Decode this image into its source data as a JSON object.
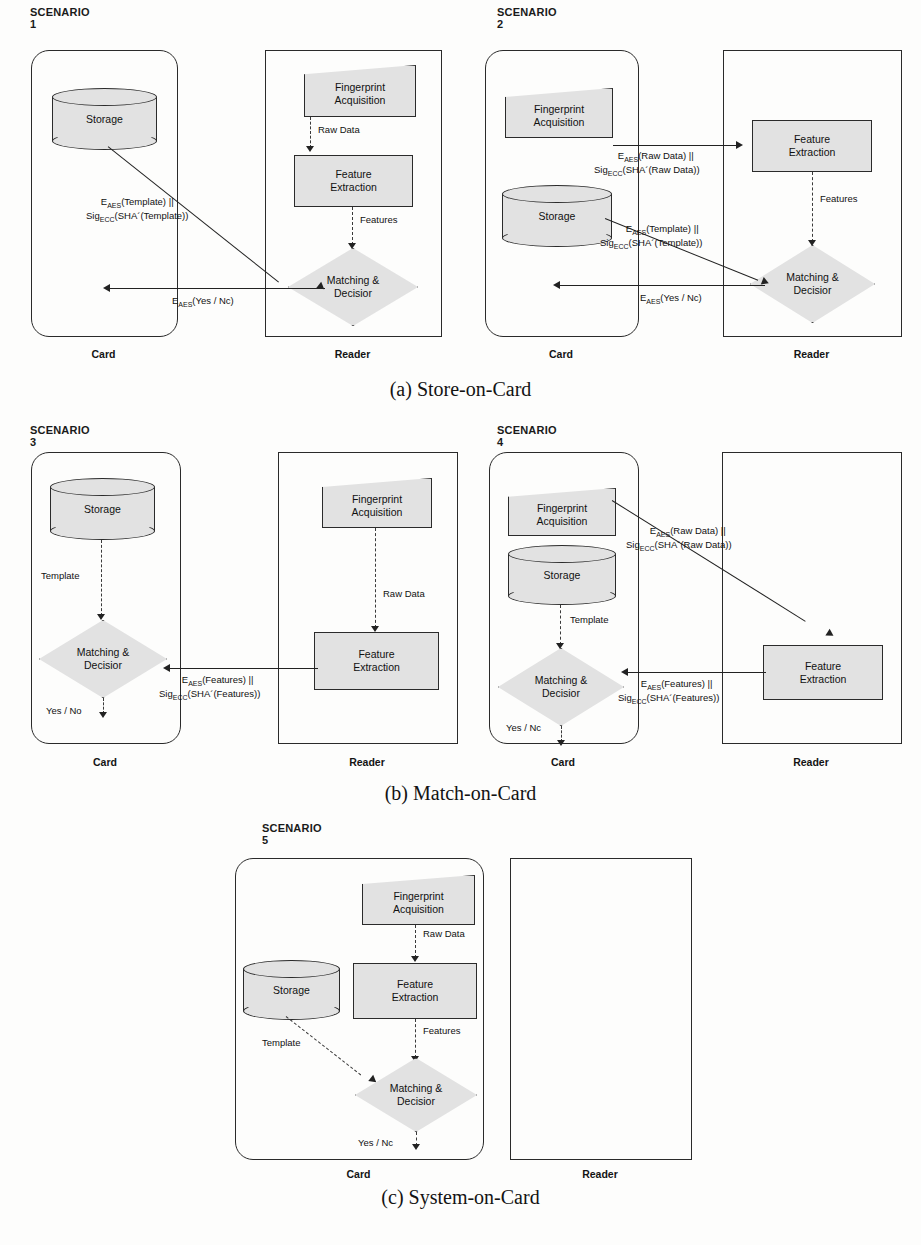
{
  "figure": {
    "captions": [
      {
        "id": "a",
        "text": "(a) Store-on-Card"
      },
      {
        "id": "b",
        "text": "(b) Match-on-Card"
      },
      {
        "id": "c",
        "text": "(c) System-on-Card"
      }
    ]
  },
  "labels": {
    "card": "Card",
    "reader": "Reader",
    "storage": "Storage",
    "fingerprint_acquisition": "Fingerprint\nAcquisition",
    "fingerprint_acquisition_l1": "Fingerprint",
    "fingerprint_acquisition_l2": "Acquisition",
    "feature_extraction_l1": "Feature",
    "feature_extraction_l2": "Extraction",
    "matching_decision_l1": "Matching &",
    "matching_decision_l2": "Decisior",
    "raw_data": "Raw Data",
    "features": "Features",
    "template": "Template",
    "yes_no": "Yes / No",
    "yes_nc": "Yes / Nc"
  },
  "crypto": {
    "e_prefix": "E",
    "aes_sub": "AES",
    "sig_prefix": "Sig",
    "ecc_sub": "ECC",
    "template_line1": "(Template) ||",
    "template_line2": "(SHA´(Template))",
    "rawdata_line1": "(Raw Data) ||",
    "rawdata_line2": "(SHA´(Raw Data))",
    "features_line1": "(Features) ||",
    "features_line2": "(SHA´(Features))",
    "yesno_payload": "(Yes / Nc)"
  },
  "scenarios": [
    {
      "id": 1,
      "title": "SCENARIO 1",
      "left_container": "card",
      "right_container": "reader",
      "nodes": [
        "Storage",
        "Fingerprint Acquisition",
        "Feature Extraction",
        "Matching & Decisior"
      ],
      "flows": [
        "Storage -> Matching & Decisior : E_AES(Template) || Sig_ECC(SHA´(Template))",
        "Fingerprint Acquisition -> Feature Extraction : Raw Data",
        "Feature Extraction -> Matching & Decisior : Features",
        "Matching & Decisior -> Card : E_AES(Yes / Nc)"
      ]
    },
    {
      "id": 2,
      "title": "SCENARIO 2",
      "left_container": "card",
      "right_container": "reader",
      "nodes": [
        "Fingerprint Acquisition",
        "Storage",
        "Feature Extraction",
        "Matching & Decisior"
      ],
      "flows": [
        "Fingerprint Acquisition -> Feature Extraction : E_AES(Raw Data) || Sig_ECC(SHA´(Raw Data))",
        "Feature Extraction -> Matching & Decisior : Features",
        "Storage -> Matching & Decisior : E_AES(Template) || Sig_ECC(SHA´(Template))",
        "Matching & Decisior -> Card : E_AES(Yes / Nc)"
      ]
    },
    {
      "id": 3,
      "title": "SCENARIO 3",
      "left_container": "card",
      "right_container": "reader",
      "nodes": [
        "Storage",
        "Matching & Decisior",
        "Fingerprint Acquisition",
        "Feature Extraction"
      ],
      "flows": [
        "Storage -> Matching & Decisior : Template",
        "Fingerprint Acquisition -> Feature Extraction : Raw Data",
        "Feature Extraction -> Matching & Decisior : E_AES(Features) || Sig_ECC(SHA´(Features))",
        "Matching & Decisior -> out : Yes / No"
      ]
    },
    {
      "id": 4,
      "title": "SCENARIO 4",
      "left_container": "card",
      "right_container": "reader",
      "nodes": [
        "Fingerprint Acquisition",
        "Storage",
        "Matching & Decisior",
        "Feature Extraction"
      ],
      "flows": [
        "Fingerprint Acquisition -> Feature Extraction : E_AES(Raw Data) || Sig_ECC(SHA´(Raw Data))",
        "Storage -> Matching & Decisior : Template",
        "Feature Extraction -> Matching & Decisior : E_AES(Features) || Sig_ECC(SHA´(Features))",
        "Matching & Decisior -> out : Yes / Nc"
      ]
    },
    {
      "id": 5,
      "title": "SCENARIO 5",
      "left_container": "card",
      "right_container": "reader",
      "nodes": [
        "Fingerprint Acquisition",
        "Feature Extraction",
        "Storage",
        "Matching & Decisior"
      ],
      "flows": [
        "Fingerprint Acquisition -> Feature Extraction : Raw Data",
        "Feature Extraction -> Matching & Decisior : Features",
        "Storage -> Matching & Decisior : Template",
        "Matching & Decisior -> out : Yes / Nc"
      ]
    }
  ],
  "background_text": {
    "lines": [
      "and the",
      "with a",
      "on the",
      "Card",
      "the",
      "in",
      "of",
      "to"
    ]
  }
}
